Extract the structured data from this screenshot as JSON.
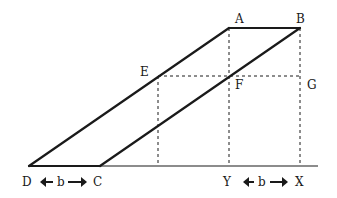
{
  "diagram": {
    "points": {
      "A": "A",
      "B": "B",
      "C": "C",
      "D": "D",
      "E": "E",
      "F": "F",
      "G": "G",
      "X": "X",
      "Y": "Y"
    },
    "dimensions": {
      "base_left": "b",
      "base_right": "b"
    },
    "colors": {
      "stroke": "#1a1a1a",
      "background": "#ffffff"
    }
  }
}
